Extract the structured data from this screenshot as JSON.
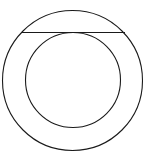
{
  "diagram": {
    "type": "geometry",
    "stroke_color": "#1a1a1a",
    "background": "#ffffff",
    "outer_circle": {
      "cx": 72.5,
      "cy": 80.5,
      "r": 70
    },
    "inner_circle": {
      "cx": 73,
      "cy": 80,
      "r": 47.5
    },
    "tangent_chord": {
      "x1": 21,
      "y1": 32.5,
      "x2": 125,
      "y2": 32.5
    }
  }
}
